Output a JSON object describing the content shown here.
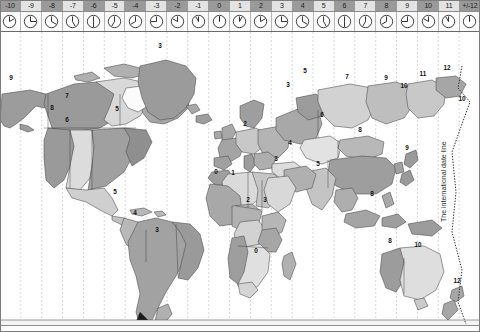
{
  "header": {
    "zones": [
      {
        "label": "-10",
        "shade": "dark",
        "hand_hour": 2
      },
      {
        "label": "-9",
        "shade": "light",
        "hand_hour": 3
      },
      {
        "label": "-8",
        "shade": "dark",
        "hand_hour": 4
      },
      {
        "label": "-7",
        "shade": "light",
        "hand_hour": 5
      },
      {
        "label": "-6",
        "shade": "dark",
        "hand_hour": 6
      },
      {
        "label": "-5",
        "shade": "light",
        "hand_hour": 7
      },
      {
        "label": "-4",
        "shade": "dark",
        "hand_hour": 8
      },
      {
        "label": "-3",
        "shade": "light",
        "hand_hour": 9
      },
      {
        "label": "-2",
        "shade": "dark",
        "hand_hour": 10
      },
      {
        "label": "-1",
        "shade": "light",
        "hand_hour": 11
      },
      {
        "label": "0",
        "shade": "dark",
        "hand_hour": 12
      },
      {
        "label": "1",
        "shade": "light",
        "hand_hour": 1
      },
      {
        "label": "2",
        "shade": "dark",
        "hand_hour": 2
      },
      {
        "label": "3",
        "shade": "light",
        "hand_hour": 3
      },
      {
        "label": "4",
        "shade": "dark",
        "hand_hour": 4
      },
      {
        "label": "5",
        "shade": "light",
        "hand_hour": 5
      },
      {
        "label": "6",
        "shade": "dark",
        "hand_hour": 6
      },
      {
        "label": "7",
        "shade": "light",
        "hand_hour": 7
      },
      {
        "label": "8",
        "shade": "dark",
        "hand_hour": 8
      },
      {
        "label": "9",
        "shade": "light",
        "hand_hour": 9
      },
      {
        "label": "10",
        "shade": "dark",
        "hand_hour": 10
      },
      {
        "label": "11",
        "shade": "light",
        "hand_hour": 11
      },
      {
        "label": "+/-12",
        "shade": "dark",
        "hand_hour": 12
      }
    ]
  },
  "map": {
    "date_line_caption": "The international date line",
    "zone_numbers": [
      {
        "text": "9",
        "x": 11,
        "y": 80,
        "region": "alaska"
      },
      {
        "text": "8",
        "x": 52,
        "y": 110,
        "region": "pacific-canada"
      },
      {
        "text": "7",
        "x": 67,
        "y": 98,
        "region": "mountain-canada"
      },
      {
        "text": "6",
        "x": 67,
        "y": 122,
        "region": "central-usa"
      },
      {
        "text": "5",
        "x": 117,
        "y": 111,
        "region": "eastern-usa"
      },
      {
        "text": "3",
        "x": 160,
        "y": 48,
        "region": "greenland"
      },
      {
        "text": "5",
        "x": 115,
        "y": 194,
        "region": "colombia-peru"
      },
      {
        "text": "4",
        "x": 135,
        "y": 215,
        "region": "bolivia-venezuela"
      },
      {
        "text": "3",
        "x": 157,
        "y": 232,
        "region": "brazil"
      },
      {
        "text": "1",
        "x": 233,
        "y": 175,
        "region": "west-africa-algeria"
      },
      {
        "text": "0",
        "x": 216,
        "y": 174,
        "region": "greenwich-africa"
      },
      {
        "text": "2",
        "x": 248,
        "y": 202,
        "region": "central-africa"
      },
      {
        "text": "3",
        "x": 265,
        "y": 202,
        "region": "east-africa"
      },
      {
        "text": "0",
        "x": 256,
        "y": 253,
        "region": "south-africa-w"
      },
      {
        "text": "2",
        "x": 245,
        "y": 126,
        "region": "europe-central"
      },
      {
        "text": "3",
        "x": 276,
        "y": 161,
        "region": "arabia"
      },
      {
        "text": "3",
        "x": 288,
        "y": 87,
        "region": "moscow"
      },
      {
        "text": "4",
        "x": 290,
        "y": 145,
        "region": "iran-gulf"
      },
      {
        "text": "5",
        "x": 305,
        "y": 73,
        "region": "urals"
      },
      {
        "text": "5",
        "x": 318,
        "y": 166,
        "region": "india"
      },
      {
        "text": "6",
        "x": 322,
        "y": 117,
        "region": "kazakhstan"
      },
      {
        "text": "7",
        "x": 347,
        "y": 79,
        "region": "siberia-west"
      },
      {
        "text": "8",
        "x": 360,
        "y": 132,
        "region": "china"
      },
      {
        "text": "9",
        "x": 386,
        "y": 80,
        "region": "siberia-east"
      },
      {
        "text": "9",
        "x": 407,
        "y": 150,
        "region": "japan"
      },
      {
        "text": "10",
        "x": 404,
        "y": 88,
        "region": "vladivostok"
      },
      {
        "text": "11",
        "x": 423,
        "y": 76,
        "region": "kamchatka"
      },
      {
        "text": "12",
        "x": 447,
        "y": 70,
        "region": "chukotka"
      },
      {
        "text": "10",
        "x": 462,
        "y": 101,
        "region": "pacific-isl"
      },
      {
        "text": "8",
        "x": 390,
        "y": 243,
        "region": "west-australia"
      },
      {
        "text": "10",
        "x": 418,
        "y": 247,
        "region": "east-australia"
      },
      {
        "text": "12",
        "x": 457,
        "y": 283,
        "region": "new-zealand"
      },
      {
        "text": "8",
        "x": 372,
        "y": 196,
        "region": "indonesia"
      }
    ]
  }
}
